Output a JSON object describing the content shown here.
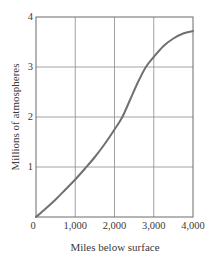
{
  "chart_data": {
    "type": "line",
    "title": "",
    "xlabel": "Miles below surface",
    "ylabel": "Millions of atmospheres",
    "xlim": [
      0,
      4000
    ],
    "ylim": [
      0,
      4
    ],
    "grid": true,
    "legend": null,
    "x_ticks": [
      "0",
      "1,000",
      "2,000",
      "3,000",
      "4,000"
    ],
    "y_ticks": [
      "1",
      "2",
      "3",
      "4"
    ],
    "series": [
      {
        "name": "Pressure",
        "x": [
          0,
          250,
          500,
          750,
          1000,
          1250,
          1500,
          1750,
          2000,
          2200,
          2400,
          2600,
          2800,
          3000,
          3250,
          3500,
          3750,
          4000
        ],
        "values": [
          0,
          0.17,
          0.35,
          0.55,
          0.75,
          0.97,
          1.2,
          1.46,
          1.75,
          2.0,
          2.35,
          2.7,
          3.0,
          3.2,
          3.42,
          3.57,
          3.67,
          3.72
        ]
      }
    ],
    "line_color": "#707070",
    "grid_color": "#8a8a8a"
  }
}
